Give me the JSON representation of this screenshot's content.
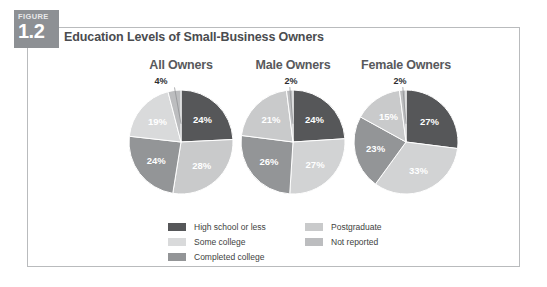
{
  "figure": {
    "tab_word": "FIGURE",
    "tab_number": "1.2",
    "heading": "Education Levels of Small-Business Owners"
  },
  "colors": {
    "high_school_or_less": "#565759",
    "some_college": "#c9cacb",
    "completed_college": "#939597",
    "postgraduate": "#d9dadb",
    "not_reported": "#bcbdbf",
    "frame_border": "#b9bbbd",
    "tab_background": "#8d9094",
    "heading_text": "#4a4c4f",
    "slice_label_light": "#ffffff",
    "slice_label_dark": "#2d2e30"
  },
  "legend": {
    "left_column": [
      {
        "label": "High school or less",
        "color": "#565759"
      },
      {
        "label": "Some college",
        "color": "#d9dadb"
      },
      {
        "label": "Completed college",
        "color": "#939597"
      }
    ],
    "right_column": [
      {
        "label": "Postgraduate",
        "color": "#c9cacb"
      },
      {
        "label": "Not reported",
        "color": "#bcbdbf"
      }
    ]
  },
  "chart_data": {
    "type": "pie",
    "title": "Education Levels of Small-Business Owners",
    "legend_position": "bottom",
    "categories": [
      "High school or less",
      "Some college",
      "Completed college",
      "Postgraduate",
      "Not reported"
    ],
    "unit": "%",
    "charts": [
      {
        "title": "All Owners",
        "top_label": "4%",
        "slices": [
          {
            "name": "High school or less",
            "value": 24,
            "label": "24%",
            "color": "#565759",
            "label_color": "#ffffff"
          },
          {
            "name": "Some college",
            "value": 28,
            "label": "28%",
            "color": "#c9cacb",
            "label_color": "#ffffff"
          },
          {
            "name": "Completed college",
            "value": 24,
            "label": "24%",
            "color": "#939597",
            "label_color": "#ffffff"
          },
          {
            "name": "Postgraduate",
            "value": 19,
            "label": "19%",
            "color": "#d9dadb",
            "label_color": "#ffffff"
          },
          {
            "name": "Not reported",
            "value": 4,
            "label": "4%",
            "color": "#bcbdbf",
            "label_color": "#2d2e30"
          }
        ]
      },
      {
        "title": "Male Owners",
        "top_label": "2%",
        "slices": [
          {
            "name": "High school or less",
            "value": 24,
            "label": "24%",
            "color": "#565759",
            "label_color": "#ffffff"
          },
          {
            "name": "Some college",
            "value": 27,
            "label": "27%",
            "color": "#d2d3d4",
            "label_color": "#ffffff"
          },
          {
            "name": "Completed college",
            "value": 26,
            "label": "26%",
            "color": "#939597",
            "label_color": "#ffffff"
          },
          {
            "name": "Postgraduate",
            "value": 21,
            "label": "21%",
            "color": "#c9cacb",
            "label_color": "#ffffff"
          },
          {
            "name": "Not reported",
            "value": 2,
            "label": "2%",
            "color": "#bcbdbf",
            "label_color": "#2d2e30"
          }
        ]
      },
      {
        "title": "Female Owners",
        "top_label": "2%",
        "slices": [
          {
            "name": "High school or less",
            "value": 27,
            "label": "27%",
            "color": "#565759",
            "label_color": "#ffffff"
          },
          {
            "name": "Some college",
            "value": 33,
            "label": "33%",
            "color": "#d2d3d4",
            "label_color": "#ffffff"
          },
          {
            "name": "Completed college",
            "value": 23,
            "label": "23%",
            "color": "#939597",
            "label_color": "#ffffff"
          },
          {
            "name": "Postgraduate",
            "value": 15,
            "label": "15%",
            "color": "#c9cacb",
            "label_color": "#ffffff"
          },
          {
            "name": "Not reported",
            "value": 2,
            "label": "2%",
            "color": "#bcbdbf",
            "label_color": "#2d2e30"
          }
        ]
      }
    ]
  }
}
